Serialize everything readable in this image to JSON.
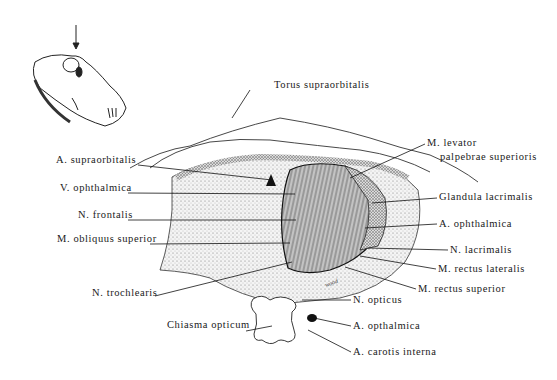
{
  "figure": {
    "inset": "skull-orientation-sketch with downward arrow",
    "labels_left": [
      {
        "id": "a-supraorbitalis",
        "text": "A. supraorbitalis",
        "x": 56,
        "y": 161
      },
      {
        "id": "v-ophthalmica",
        "text": "V. ophthalmica",
        "x": 60,
        "y": 187
      },
      {
        "id": "n-frontalis",
        "text": "N. frontalis",
        "x": 78,
        "y": 214
      },
      {
        "id": "m-obliquus-superior",
        "text": "M. obliquus superior",
        "x": 57,
        "y": 239
      },
      {
        "id": "n-trochlearis",
        "text": "N. trochlearis",
        "x": 92,
        "y": 293
      },
      {
        "id": "chiasma-opticum",
        "text": "Chiasma opticum",
        "x": 167,
        "y": 325
      }
    ],
    "labels_right": [
      {
        "id": "torus-supraorbitalis",
        "text": "Torus supraorbitalis",
        "x": 274,
        "y": 85
      },
      {
        "id": "m-levator-1",
        "text": "M. levator",
        "x": 425,
        "y": 141
      },
      {
        "id": "m-levator-2",
        "text": "palpebrae superioris",
        "x": 440,
        "y": 155
      },
      {
        "id": "glandula-lacrimalis",
        "text": "Glandula lacrimalis",
        "x": 439,
        "y": 195
      },
      {
        "id": "a-ophthalmica",
        "text": "A. ophthalmica",
        "x": 439,
        "y": 221
      },
      {
        "id": "n-lacrimalis",
        "text": "N. lacrimalis",
        "x": 450,
        "y": 247
      },
      {
        "id": "m-rectus-lateralis",
        "text": "M. rectus lateralis",
        "x": 438,
        "y": 266
      },
      {
        "id": "m-rectus-superior",
        "text": "M. rectus superior",
        "x": 418,
        "y": 286
      },
      {
        "id": "n-opticus",
        "text": "N. opticus",
        "x": 353,
        "y": 297
      },
      {
        "id": "a-opthalmica-lower",
        "text": "A. opthalmica",
        "x": 353,
        "y": 323
      },
      {
        "id": "a-carotis-interna",
        "text": "A. carotis interna",
        "x": 353,
        "y": 349
      }
    ],
    "signature": "wood"
  }
}
